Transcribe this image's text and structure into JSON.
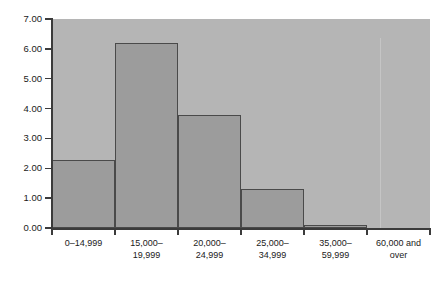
{
  "chart_data": {
    "type": "bar",
    "title": "",
    "subtitle": "",
    "xlabel": "",
    "ylabel": "Percent per $1,000",
    "categories": [
      "0–14,999",
      "15,000–\n19,999",
      "20,000–\n24,999",
      "25,000–\n34,999",
      "35,000–\n59,999",
      "60,000 and\nover"
    ],
    "values": [
      2.28,
      6.2,
      3.78,
      1.31,
      0.1,
      0.0
    ],
    "ylim": [
      0.0,
      7.0
    ],
    "yticks": [
      0.0,
      1.0,
      2.0,
      3.0,
      4.0,
      5.0,
      6.0,
      7.0
    ],
    "ytick_labels": [
      "0.00",
      "1.00",
      "2.00",
      "3.00",
      "4.00",
      "5.00",
      "6.00",
      "7.00"
    ],
    "grid": false,
    "legend": null,
    "legend_position": "none",
    "bar_style": "histogram-adjacent",
    "annotations": []
  },
  "figure": {
    "caption": "",
    "plot_background_color": "#b5b5b5",
    "bar_fill_color": "#9c9c9c",
    "bar_edge_color": "#4a4a4a",
    "axis_color": "#3b3b3b",
    "text_color": "#1a1a1a",
    "page_background_color": "#ffffff"
  }
}
